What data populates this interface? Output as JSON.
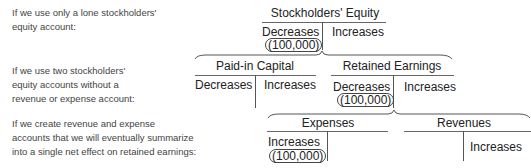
{
  "descriptions": [
    {
      "lines": [
        "If we use only a lone stockholders'",
        "equity account:"
      ]
    },
    {
      "lines": [
        "If we use two stockholders'",
        "equity accounts without a",
        "revenue or expense account:"
      ]
    },
    {
      "lines": [
        "If we create revenue and expense",
        "accounts that we will eventually summarize",
        "into a single net effect on retained earnings:"
      ]
    }
  ],
  "accounts": {
    "stockholders_equity": {
      "title": "Stockholders' Equity",
      "left": "Decreases",
      "right": "Increases",
      "entry": "(100,000)"
    },
    "paid_in_capital": {
      "title": "Paid-in Capital",
      "left": "Decreases",
      "right": "Increases"
    },
    "retained_earnings": {
      "title": "Retained Earnings",
      "left": "Decreases",
      "right": "Increases",
      "entry": "(100,000)"
    },
    "expenses": {
      "title": "Expenses",
      "left": "Increases",
      "entry": "(100,000)"
    },
    "revenues": {
      "title": "Revenues",
      "right": "Increases"
    }
  },
  "colors": {
    "text": "#222222",
    "description_text": "#444444",
    "lines": "#666666"
  }
}
